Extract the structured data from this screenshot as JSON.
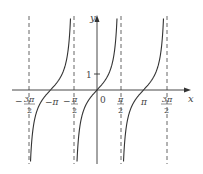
{
  "chart_data": {
    "type": "line",
    "title": "",
    "function": "y = tan(x)",
    "xlabel": "x",
    "ylabel": "y",
    "xlim": [
      -4.9,
      5.0
    ],
    "ylim": [
      -4.5,
      5.0
    ],
    "grid": false,
    "legend": null,
    "x_ticks": [
      {
        "value": -4.712,
        "label": "−3π/2",
        "num": "3π",
        "den": "2",
        "neg": true
      },
      {
        "value": -3.1416,
        "label": "−π",
        "num": "π",
        "den": "",
        "neg": true
      },
      {
        "value": -1.5708,
        "label": "−π/2",
        "num": "π",
        "den": "2",
        "neg": true
      },
      {
        "value": 0,
        "label": "0"
      },
      {
        "value": 1.5708,
        "label": "π/2",
        "num": "π",
        "den": "2",
        "neg": false
      },
      {
        "value": 3.1416,
        "label": "π",
        "num": "π",
        "den": "",
        "neg": false
      },
      {
        "value": 4.712,
        "label": "3π/2",
        "num": "3π",
        "den": "2",
        "neg": false
      }
    ],
    "y_ticks": [
      {
        "value": 1,
        "label": "1"
      }
    ],
    "asymptotes": [
      -4.712,
      -1.5708,
      1.5708,
      4.712
    ],
    "series": [
      {
        "name": "tan(x) branch 1",
        "x_range": [
          -4.712,
          -1.5708
        ],
        "zero_at": -3.1416
      },
      {
        "name": "tan(x) branch 2",
        "x_range": [
          -1.5708,
          1.5708
        ],
        "zero_at": 0
      },
      {
        "name": "tan(x) branch 3",
        "x_range": [
          1.5708,
          4.712
        ],
        "zero_at": 3.1416
      }
    ]
  },
  "labels": {
    "x_axis": "x",
    "y_axis": "y",
    "origin": "0",
    "one": "1",
    "neg_three_pi_over_2_num": "3π",
    "neg_three_pi_over_2_den": "2",
    "neg_pi": "−π",
    "neg_pi_over_2_num": "π",
    "neg_pi_over_2_den": "2",
    "pi_over_2_num": "π",
    "pi_over_2_den": "2",
    "pi": "π",
    "three_pi_over_2_num": "3π",
    "three_pi_over_2_den": "2",
    "minus": "−"
  }
}
